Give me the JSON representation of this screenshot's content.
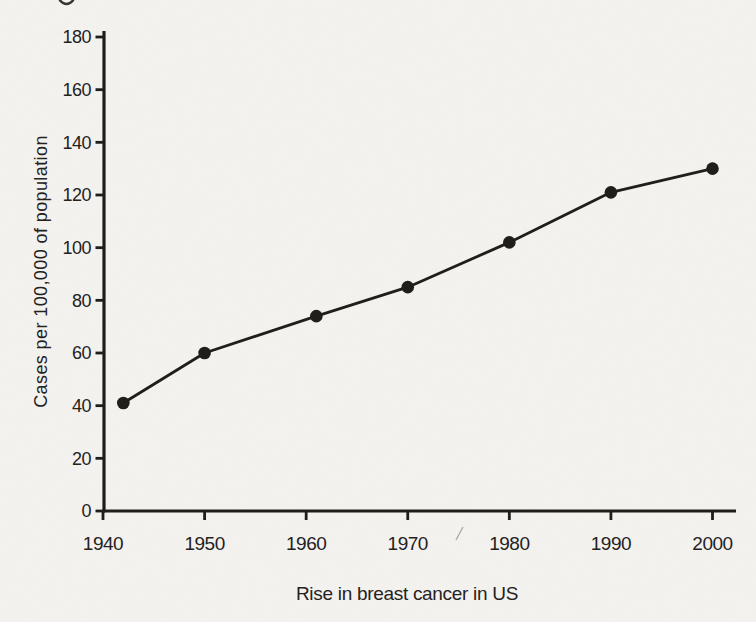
{
  "page": {
    "background_color": "#f4f3f0",
    "ink_color": "#201e1b"
  },
  "chart_data": {
    "type": "line",
    "title": "",
    "caption": "Rise in breast cancer in US",
    "xlabel": "",
    "ylabel": "Cases per 100,000 of population",
    "x": [
      1942,
      1950,
      1961,
      1970,
      1980,
      1990,
      2000
    ],
    "y": [
      41,
      60,
      74,
      85,
      102,
      121,
      130
    ],
    "xlim": [
      1940,
      2000
    ],
    "ylim": [
      0,
      180
    ],
    "x_ticks": [
      1940,
      1950,
      1960,
      1970,
      1980,
      1990,
      2000
    ],
    "y_ticks": [
      0,
      20,
      40,
      60,
      80,
      100,
      120,
      140,
      160,
      180
    ],
    "grid": false,
    "legend": false,
    "marker": "filled-circle",
    "marker_color": "#201e1b",
    "line_color": "#201e1b"
  }
}
